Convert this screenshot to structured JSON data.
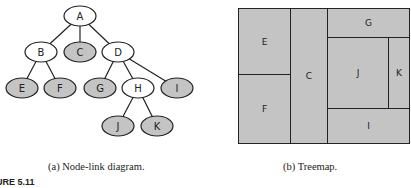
{
  "node_link": {
    "caption": "(a) Node-link diagram.",
    "colors": {
      "leaf_fill": "#c4c4c4",
      "internal_fill": "#ffffff",
      "stroke": "#222222"
    },
    "nodes": [
      {
        "id": "A",
        "label": "A",
        "x": 80,
        "y": 16,
        "leaf": false
      },
      {
        "id": "B",
        "label": "B",
        "x": 41,
        "y": 52,
        "leaf": false
      },
      {
        "id": "C",
        "label": "C",
        "x": 80,
        "y": 52,
        "leaf": true
      },
      {
        "id": "D",
        "label": "D",
        "x": 118,
        "y": 52,
        "leaf": false
      },
      {
        "id": "E",
        "label": "E",
        "x": 22,
        "y": 88,
        "leaf": true
      },
      {
        "id": "F",
        "label": "F",
        "x": 60,
        "y": 88,
        "leaf": true
      },
      {
        "id": "G",
        "label": "G",
        "x": 100,
        "y": 88,
        "leaf": true
      },
      {
        "id": "H",
        "label": "H",
        "x": 138,
        "y": 88,
        "leaf": false
      },
      {
        "id": "I",
        "label": "I",
        "x": 177,
        "y": 88,
        "leaf": true
      },
      {
        "id": "J",
        "label": "J",
        "x": 118,
        "y": 126,
        "leaf": true
      },
      {
        "id": "K",
        "label": "K",
        "x": 157,
        "y": 126,
        "leaf": true
      }
    ],
    "edges": [
      [
        "A",
        "B"
      ],
      [
        "A",
        "C"
      ],
      [
        "A",
        "D"
      ],
      [
        "B",
        "E"
      ],
      [
        "B",
        "F"
      ],
      [
        "D",
        "G"
      ],
      [
        "D",
        "H"
      ],
      [
        "D",
        "I"
      ],
      [
        "H",
        "J"
      ],
      [
        "H",
        "K"
      ]
    ]
  },
  "treemap": {
    "caption": "(b) Treemap.",
    "cells": [
      {
        "label": "E",
        "x": 0,
        "y": 0,
        "w": 53,
        "h": 67
      },
      {
        "label": "F",
        "x": 0,
        "y": 66,
        "w": 53,
        "h": 70
      },
      {
        "label": "C",
        "x": 52,
        "y": 0,
        "w": 38,
        "h": 136
      },
      {
        "label": "G",
        "x": 89,
        "y": 0,
        "w": 83,
        "h": 30
      },
      {
        "label": "J",
        "x": 89,
        "y": 29,
        "w": 62,
        "h": 72
      },
      {
        "label": "K",
        "x": 150,
        "y": 29,
        "w": 22,
        "h": 72
      },
      {
        "label": "I",
        "x": 89,
        "y": 100,
        "w": 83,
        "h": 36
      }
    ]
  },
  "figure_label": "URE 5.11"
}
